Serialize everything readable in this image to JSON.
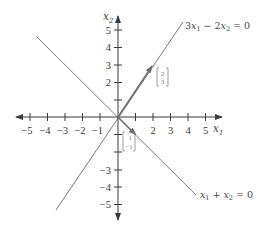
{
  "figure": {
    "axes": {
      "x_label": "x",
      "x_sub": "1",
      "y_label": "x",
      "y_sub": "2",
      "x_ticks": [
        "−5",
        "−4",
        "−3",
        "−2",
        "−1",
        "2",
        "3",
        "4",
        "5"
      ],
      "y_ticks_pos": [
        "5",
        "4",
        "3",
        "2"
      ],
      "y_ticks_neg": [
        "−3",
        "−4",
        "−5"
      ],
      "range": [
        -5,
        5
      ]
    },
    "lines": [
      {
        "name": "row-space-line",
        "equation_parts": [
          "3",
          "x",
          "1",
          " − 2",
          "x",
          "2",
          " = 0"
        ],
        "label": "3x1 − 2x2 = 0"
      },
      {
        "name": "null-space-line",
        "equation_parts": [
          "x",
          "1",
          " + ",
          "x",
          "2",
          " = 0"
        ],
        "label": "x1 + x2 = 0"
      }
    ],
    "vectors": [
      {
        "name": "vector-2-3",
        "top": "2",
        "bottom": "3"
      },
      {
        "name": "vector-1-neg1",
        "top": "1",
        "bottom": "−1"
      }
    ],
    "colors": {
      "axis": "#3a3a3a",
      "line": "#6e6e6e",
      "text": "#3a3a3a",
      "vector_label": "#888888"
    }
  }
}
